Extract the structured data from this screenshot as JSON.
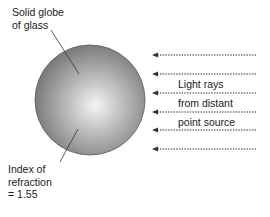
{
  "diagram": {
    "globe": {
      "label_line1": "Solid globe",
      "label_line2": "of glass",
      "center": [
        90,
        100
      ],
      "radius": 55,
      "colors": {
        "highlight": "#f2f2f2",
        "mid": "#a8a8a8",
        "edge": "#7a7a7a",
        "outline": "#555555"
      }
    },
    "index_label": {
      "line1": "Index of",
      "line2": "refraction",
      "line3": "= 1.55"
    },
    "rays": {
      "label_line1": "Light rays",
      "label_line2": "from distant",
      "label_line3": "point source",
      "y_positions": [
        55,
        74,
        93,
        112,
        130,
        149
      ],
      "x_start": 256,
      "x_end": 152,
      "color": "#333333",
      "style": "dotted with arrowhead pointing left"
    }
  }
}
